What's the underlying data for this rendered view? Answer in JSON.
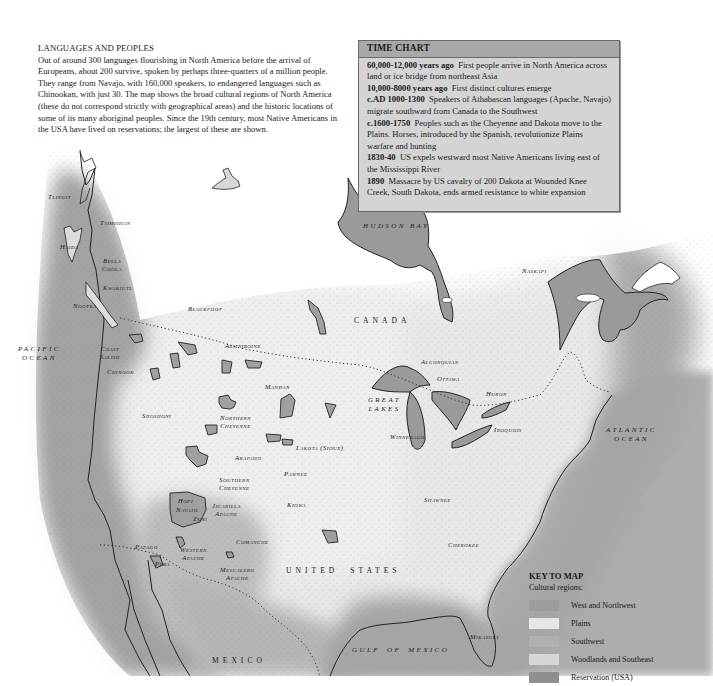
{
  "intro": {
    "title": "LANGUAGES AND PEOPLES",
    "body": "Out of around 300 languages flourishing in North America before the arrival of Europeans, about 200 survive, spoken by perhaps three-quarters of a million people. They range from Navajo, with 160,000 speakers, to endangered languages such as Chinookan, with just 30. The map shows the broad cultural regions of North America (these do not correspond strictly with geographical areas) and the historic locations of some of its many aboriginal peoples. Since the 19th century, most Native Americans in the USA have lived on reservations; the largest of these are shown."
  },
  "time_chart": {
    "title": "TIME CHART",
    "entries": [
      {
        "date": "60,000-12,000 years ago",
        "text": "First people arrive in North America across land or ice bridge from northeast Asia"
      },
      {
        "date": "10,000-8000 years ago",
        "text": "First distinct cultures emerge"
      },
      {
        "date": "c.AD 1000-1300",
        "text": "Speakers of Athabascan languages (Apache, Navajo) migrate southward from Canada to the Southwest"
      },
      {
        "date": "c.1600-1750",
        "text": "Peoples such as the Cheyenne and Dakota move to the Plains. Horses, introduced by the Spanish, revolutionize Plains warfare and hunting"
      },
      {
        "date": "1830-40",
        "text": "US expels westward most Native Americans living east of the Mississippi River"
      },
      {
        "date": "1890",
        "text": "Massacre by US cavalry of 200 Dakota at Wounded Knee Creek, South Dakota, ends armed resistance to white expansion"
      }
    ]
  },
  "map": {
    "countries": {
      "canada": "CANADA",
      "united_states": "UNITED   STATES",
      "mexico": "MEXICO"
    },
    "water": {
      "pacific": "PACIFIC\nOCEAN",
      "atlantic": "ATLANTIC\nOCEAN",
      "hudson_bay": "HUDSON BAY",
      "gulf_of_mexico": "GULF OF MEXICO",
      "great_lakes": "GREAT\nLAKES"
    },
    "peoples": {
      "tlingit": "Tlingit",
      "tsimshian": "Tsimshian",
      "haida": "Haida",
      "bella_coola": "Bella\nCoola",
      "kwakiutl": "Kwakiutl",
      "nootka": "Nootka",
      "coast_salish": "Coast\nSalish",
      "chinook": "Chinook",
      "blackfoot": "Blackfoot",
      "assiniboine": "Assiniboine",
      "shoshoni": "Shoshoni",
      "mandan": "Mandan",
      "northern_cheyenne": "Northern\nCheyenne",
      "lakota": "Lakota (Sioux)",
      "arapaho": "Arapaho",
      "pawnee": "Pawnee",
      "southern_cheyenne": "Southern\nCheyenne",
      "kiowa": "Kiowa",
      "hopi": "Hopi",
      "navajo": "Navajo",
      "zuni": "Zuni",
      "jicarilla_apache": "Jicarilla\nApache",
      "comanche": "Comanche",
      "papago": "Papago",
      "western_apache": "Western\nApache",
      "pima": "Pima",
      "mescalero_apache": "Mescalero\nApache",
      "naskapi": "Naskapi",
      "algonquian": "Algonquian",
      "ottawa": "Ottawa",
      "huron": "Huron",
      "iroquois": "Iroquois",
      "winnebago": "Winnebago",
      "shawnee": "Shawnee",
      "cherokee": "Cherokee",
      "mikasuki": "Mikasuki"
    }
  },
  "key": {
    "title": "KEY TO MAP",
    "subtitle": "Cultural regions:",
    "items": [
      {
        "label": "West and Northwest",
        "color": "#9c9c9c"
      },
      {
        "label": "Plains",
        "color": "#e6e6e6"
      },
      {
        "label": "Southwest",
        "color": "#b0b0b0"
      },
      {
        "label": "Woodlands and Southeast",
        "color": "#d6d6d6"
      },
      {
        "label": "Reservation (USA)",
        "color": "#8f8f8f"
      }
    ]
  },
  "colors": {
    "water_fill": "#9a9a9a",
    "west_region": "#a6a6a6",
    "plains_region": "#ececec",
    "woodlands_region": "#dedede",
    "reservation": "#a0a0a0",
    "timechart_bg": "#d4d4d4",
    "timechart_header": "#a8a8a8"
  }
}
